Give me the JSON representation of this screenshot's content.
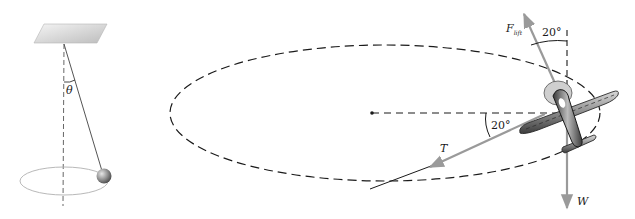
{
  "figures": {
    "pendulum": {
      "title": "conical-pendulum",
      "angle_label": "θ"
    },
    "airplane": {
      "title": "banked-airplane-circular-turn",
      "forces": {
        "lift": {
          "symbol": "F",
          "subscript": "lift"
        },
        "tension": {
          "symbol": "T"
        },
        "weight": {
          "symbol": "W"
        }
      },
      "angles": {
        "lift_from_vertical": "20°",
        "tension_from_horizontal": "20°"
      }
    }
  },
  "colors": {
    "dashed_line": "#1a1a1a",
    "force_arrow": "#9a9a9a",
    "ceiling": "#d8d8d8",
    "ball": "#8a8a8a",
    "airplane_body": "#7a7a7a",
    "propeller_disc": "#c8c8c8"
  }
}
